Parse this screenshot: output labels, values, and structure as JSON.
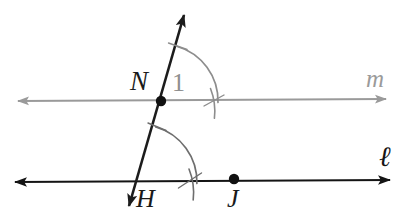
{
  "figure": {
    "kind": "geometry-diagram",
    "width": 403,
    "height": 223,
    "background_color": "#ffffff"
  },
  "labels": {
    "point_N": "N",
    "point_H": "H",
    "point_J": "J",
    "angle_1": "1",
    "line_m": "m",
    "line_l": "ℓ"
  },
  "colors": {
    "line_m_color": "#9a9a9a",
    "line_l_color": "#141414",
    "transversal_color": "#1c1c1c",
    "arc_upper_color": "#8d8d8d",
    "arc_lower_color": "#6e6e6e",
    "point_color": "#111111",
    "angle_label_color": "#8f8f8f"
  },
  "geometry": {
    "line_m": {
      "name": "m",
      "type": "double-arrow-line",
      "x1": 18,
      "y1": 101,
      "x2": 386,
      "y2": 99,
      "stroke_width": 2
    },
    "line_l": {
      "name": "l",
      "type": "double-arrow-line",
      "x1": 15,
      "y1": 182,
      "x2": 390,
      "y2": 180,
      "stroke_width": 2.2
    },
    "transversal": {
      "name": "NH",
      "type": "double-arrow-line",
      "x1": 184,
      "y1": 13,
      "x2": 128,
      "y2": 209,
      "stroke_width": 2.6
    },
    "points": [
      {
        "name": "N",
        "x": 161,
        "y": 101,
        "radius": 5.2
      },
      {
        "name": "J",
        "x": 234,
        "y": 179,
        "radius": 5.2
      }
    ],
    "arcs": [
      {
        "name": "angle-1-arc",
        "center_x": 161,
        "center_y": 101,
        "radius": 57,
        "start_deg": -74,
        "end_deg": 2,
        "tick": true
      },
      {
        "name": "angle-H-arc",
        "center_x": 140,
        "center_y": 182,
        "radius": 57,
        "start_deg": -105,
        "end_deg": -2,
        "tick": true
      }
    ]
  }
}
